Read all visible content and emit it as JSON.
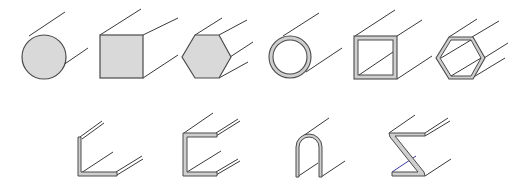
{
  "figure": {
    "colors": {
      "background": "#ffffff",
      "fill": "#d9d9d9",
      "wall_fill": "#cfcfcf",
      "line": "#3a3a3a"
    },
    "rows": [
      {
        "name": "closed-profiles",
        "shapes": [
          {
            "id": "solid-round-bar",
            "type": "solid",
            "section": "circle"
          },
          {
            "id": "solid-square-bar",
            "type": "solid",
            "section": "square"
          },
          {
            "id": "solid-hexagonal-bar",
            "type": "solid",
            "section": "hexagon"
          },
          {
            "id": "round-tube",
            "type": "hollow",
            "section": "circle"
          },
          {
            "id": "square-tube",
            "type": "hollow",
            "section": "square"
          },
          {
            "id": "hexagonal-tube",
            "type": "hollow",
            "section": "hexagon"
          }
        ]
      },
      {
        "name": "open-profiles",
        "shapes": [
          {
            "id": "angle-profile",
            "type": "open",
            "section": "L"
          },
          {
            "id": "channel-profile",
            "type": "open",
            "section": "C"
          },
          {
            "id": "u-profile",
            "type": "open",
            "section": "U"
          },
          {
            "id": "z-profile",
            "type": "open",
            "section": "Z"
          }
        ]
      }
    ]
  }
}
